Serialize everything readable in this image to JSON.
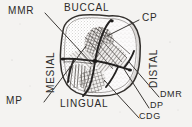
{
  "figure": {
    "background_color": "#f4f3f1",
    "ink_color": "#2b2a28"
  },
  "orientation_labels": {
    "buccal": "BUCCAL",
    "lingual": "LINGUAL",
    "mesial": "MESIAL",
    "distal": "DISTAL"
  },
  "callouts": [
    {
      "key": "mmr",
      "label": "MMR"
    },
    {
      "key": "mp",
      "label": "MP"
    },
    {
      "key": "cp",
      "label": "CP"
    },
    {
      "key": "dmr",
      "label": "DMR"
    },
    {
      "key": "dp",
      "label": "DP"
    },
    {
      "key": "cdg",
      "label": "CDG"
    }
  ]
}
